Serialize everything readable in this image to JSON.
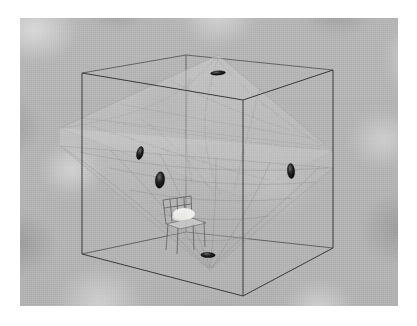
{
  "image": {
    "title": "3D room acoustics scene render",
    "border_color": "#ffffff",
    "background_color": "#b4b4b4",
    "wireframe_color": "#404040",
    "marker_color": "#1a1a1a",
    "volume_color": "#c9c9c9",
    "width": 417,
    "height": 326,
    "content_rect": {
      "x": 20,
      "y": 18,
      "width": 378,
      "height": 288
    }
  },
  "scene": {
    "room_label": "room-bounding-box",
    "objects": [
      {
        "name": "wireframe-room-cube",
        "type": "box",
        "description": "transparent cuboid room outline"
      },
      {
        "name": "acoustic-volume",
        "type": "octahedron",
        "description": "translucent textured double-cone / octahedral iso-surface"
      },
      {
        "name": "chair",
        "type": "furniture",
        "description": "small wireframe chair on the floor"
      }
    ],
    "markers": [
      {
        "name": "marker-ceiling",
        "position": "top",
        "x": 218,
        "y": 73,
        "rx": 7.5,
        "ry": 2.0,
        "rot": -4
      },
      {
        "name": "marker-left-upper",
        "position": "left-wall",
        "x": 140,
        "y": 153,
        "rx": 3.0,
        "ry": 6.5,
        "rot": 12
      },
      {
        "name": "marker-left-lower",
        "position": "left-wall",
        "x": 160,
        "y": 180,
        "rx": 4.5,
        "ry": 8.0,
        "rot": 6
      },
      {
        "name": "marker-right",
        "position": "right-wall",
        "x": 291,
        "y": 171,
        "rx": 3.5,
        "ry": 7.5,
        "rot": -4
      },
      {
        "name": "marker-floor",
        "position": "floor",
        "x": 208,
        "y": 255,
        "rx": 7.0,
        "ry": 2.5,
        "rot": 2
      }
    ],
    "cube_vertices": {
      "top_front": {
        "x": 243,
        "y": 100
      },
      "top_left": {
        "x": 82,
        "y": 73
      },
      "top_back": {
        "x": 186,
        "y": 55
      },
      "top_right": {
        "x": 333,
        "y": 70
      },
      "bot_front": {
        "x": 243,
        "y": 296
      },
      "bot_left": {
        "x": 82,
        "y": 254
      },
      "bot_back": {
        "x": 186,
        "y": 232
      },
      "bot_right": {
        "x": 333,
        "y": 248
      }
    }
  }
}
